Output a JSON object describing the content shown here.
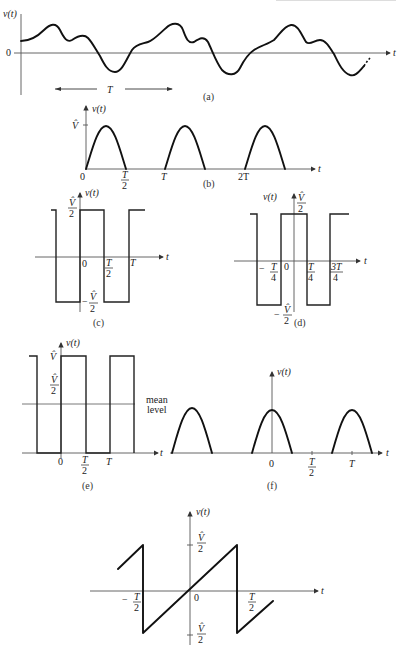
{
  "page": {
    "header_fragment": "faded running page header"
  },
  "panels": {
    "a": {
      "caption": "(a)",
      "ylabel": "v(t)",
      "xlabel": "t",
      "zero_label": "0",
      "period_label": "T",
      "description": "Arbitrary periodic waveform with period T"
    },
    "b": {
      "caption": "(b)",
      "ylabel": "v(t)",
      "xlabel": "t",
      "peak_label": "V̂",
      "ticks": [
        "0",
        "T/2",
        "T",
        "2T"
      ],
      "description": "Half-wave rectified sinusoid"
    },
    "c": {
      "caption": "(c)",
      "ylabel": "v(t)",
      "xlabel": "t",
      "high_label_num": "V̂",
      "high_label_den": "2",
      "low_label_prefix": "−",
      "low_label_num": "V̂",
      "low_label_den": "2",
      "ticks": [
        "0",
        "T/2",
        "T"
      ],
      "description": "Square wave, odd symmetry"
    },
    "d": {
      "caption": "(d)",
      "ylabel": "v(t)",
      "xlabel": "t",
      "high_label_num": "V̂",
      "high_label_den": "2",
      "low_label_prefix": "−",
      "low_label_num": "V̂",
      "low_label_den": "2",
      "ticks": [
        "−T/4",
        "0",
        "T/4",
        "3T/4"
      ],
      "description": "Square wave, even symmetry"
    },
    "e": {
      "caption": "(e)",
      "ylabel": "v(t)",
      "xlabel": "t",
      "peak_label": "V̂",
      "half_label_num": "V̂",
      "half_label_den": "2",
      "mean_label_line1": "mean",
      "mean_label_line2": "level",
      "ticks": [
        "0",
        "T/2",
        "T"
      ],
      "description": "Unipolar square wave with mean level V/2"
    },
    "f": {
      "caption": "(f)",
      "ylabel": "v(t)",
      "xlabel": "t",
      "ticks": [
        "0",
        "T/2",
        "T"
      ],
      "description": "Half-wave rectified cosine (even)"
    },
    "g": {
      "ylabel": "v(t)",
      "xlabel": "t",
      "high_label_num": "V̂",
      "high_label_den": "2",
      "low_label_num": "V̂",
      "low_label_den": "2",
      "ticks": [
        "−T/2",
        "0",
        "T/2"
      ],
      "description": "Sawtooth wave, odd symmetry"
    }
  },
  "colors": {
    "ink": "#111111",
    "axis": "#555555",
    "background": "#ffffff"
  }
}
